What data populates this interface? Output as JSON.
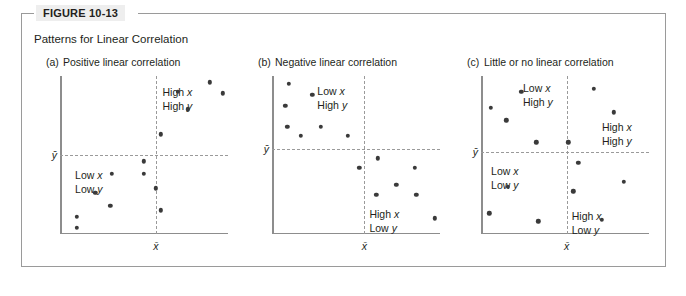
{
  "figure": {
    "tab_label": "FIGURE 10-13",
    "title": "Patterns for Linear Correlation",
    "frame_color": "#9a9a9a",
    "tab_background": "#eeeeee",
    "dot_color": "#3a3a3a",
    "axis_color": "#8d8d8d",
    "mean_line_color": "#9a9a9a"
  },
  "axis_labels": {
    "x_mean": "x̄",
    "y_mean": "ȳ"
  },
  "chart_data": [
    {
      "type": "scatter",
      "panel": "a",
      "caption_letter": "(a)",
      "caption_text": "Positive linear correlation",
      "title": "Positive linear correlation",
      "xlabel": "x̄",
      "ylabel": "ȳ",
      "xlim": [
        0,
        100
      ],
      "ylim": [
        0,
        100
      ],
      "grid": false,
      "mean_x": 57,
      "mean_y": 50,
      "annotations": [
        {
          "text_line1": "High x",
          "text_line2": "High y",
          "quadrant": "upper-right",
          "x": 61,
          "y": 94
        },
        {
          "text_line1": "Low x",
          "text_line2": "Low y",
          "quadrant": "lower-left",
          "x": 9,
          "y": 42
        }
      ],
      "points": [
        {
          "x": 60,
          "y": 15
        },
        {
          "x": 57,
          "y": 29
        },
        {
          "x": 50,
          "y": 46
        },
        {
          "x": 50,
          "y": 38
        },
        {
          "x": 31,
          "y": 38
        },
        {
          "x": 21,
          "y": 26
        },
        {
          "x": 30,
          "y": 18
        },
        {
          "x": 10,
          "y": 11
        },
        {
          "x": 10,
          "y": 4
        },
        {
          "x": 60,
          "y": 63
        },
        {
          "x": 76,
          "y": 79
        },
        {
          "x": 70,
          "y": 90
        },
        {
          "x": 89,
          "y": 96
        },
        {
          "x": 97,
          "y": 89
        }
      ]
    },
    {
      "type": "scatter",
      "panel": "b",
      "caption_letter": "(b)",
      "caption_text": "Negative linear correlation",
      "title": "Negative linear correlation",
      "xlabel": "x̄",
      "ylabel": "ȳ",
      "xlim": [
        0,
        100
      ],
      "ylim": [
        0,
        100
      ],
      "grid": false,
      "mean_x": 55,
      "mean_y": 54,
      "annotations": [
        {
          "text_line1": "Low x",
          "text_line2": "High y",
          "quadrant": "upper-left",
          "x": 27,
          "y": 95
        },
        {
          "text_line1": "High x",
          "text_line2": "Low y",
          "quadrant": "lower-right",
          "x": 58,
          "y": 17
        }
      ],
      "points": [
        {
          "x": 10,
          "y": 95
        },
        {
          "x": 24,
          "y": 88
        },
        {
          "x": 8,
          "y": 81
        },
        {
          "x": 9,
          "y": 68
        },
        {
          "x": 29,
          "y": 68
        },
        {
          "x": 17,
          "y": 62
        },
        {
          "x": 45,
          "y": 62
        },
        {
          "x": 63,
          "y": 48
        },
        {
          "x": 52,
          "y": 42
        },
        {
          "x": 85,
          "y": 42
        },
        {
          "x": 74,
          "y": 31
        },
        {
          "x": 62,
          "y": 25
        },
        {
          "x": 86,
          "y": 25
        },
        {
          "x": 97,
          "y": 10
        }
      ]
    },
    {
      "type": "scatter",
      "panel": "c",
      "caption_letter": "(c)",
      "caption_text": "Little or no linear correlation",
      "title": "Little or no linear correlation",
      "xlabel": "x̄",
      "ylabel": "ȳ",
      "xlim": [
        0,
        100
      ],
      "ylim": [
        0,
        100
      ],
      "grid": false,
      "mean_x": 51,
      "mean_y": 52,
      "annotations": [
        {
          "text_line1": "Low x",
          "text_line2": "High y",
          "quadrant": "upper-left",
          "x": 25,
          "y": 97
        },
        {
          "text_line1": "High x",
          "text_line2": "High y",
          "quadrant": "upper-right",
          "x": 72,
          "y": 72
        },
        {
          "text_line1": "Low x",
          "text_line2": "Low y",
          "quadrant": "lower-left",
          "x": 6,
          "y": 44
        },
        {
          "text_line1": "High x",
          "text_line2": "Low y",
          "quadrant": "lower-right",
          "x": 54,
          "y": 16
        }
      ],
      "points": [
        {
          "x": 24,
          "y": 90
        },
        {
          "x": 67,
          "y": 92
        },
        {
          "x": 6,
          "y": 80
        },
        {
          "x": 15,
          "y": 72
        },
        {
          "x": 79,
          "y": 77
        },
        {
          "x": 33,
          "y": 58
        },
        {
          "x": 52,
          "y": 58
        },
        {
          "x": 58,
          "y": 45
        },
        {
          "x": 16,
          "y": 30
        },
        {
          "x": 85,
          "y": 33
        },
        {
          "x": 55,
          "y": 27
        },
        {
          "x": 5,
          "y": 13
        },
        {
          "x": 34,
          "y": 8
        },
        {
          "x": 72,
          "y": 9
        }
      ]
    }
  ]
}
